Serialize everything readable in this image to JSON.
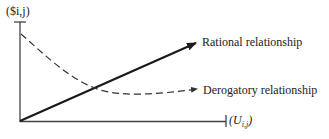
{
  "diagram": {
    "y_axis_label": "($i,j)",
    "x_axis_label": "(U",
    "x_axis_sub": "i,j",
    "x_axis_close": ")",
    "series": [
      {
        "name": "Rational relationship",
        "style": "solid",
        "trend": "increasing linear"
      },
      {
        "name": "Derogatory relationship",
        "style": "dashed",
        "trend": "decreasing then leveling"
      }
    ],
    "colors": {
      "line": "#1a1a1a",
      "axis": "#444444"
    }
  }
}
